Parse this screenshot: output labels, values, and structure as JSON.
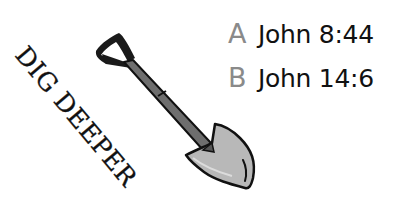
{
  "title": "DIG DEEPER",
  "illustration": {
    "icon": "shovel-icon",
    "colors": {
      "outline": "#111111",
      "handle": "#555555",
      "blade": "#b8b8b8"
    }
  },
  "references": [
    {
      "letter": "A",
      "text": "John 8:44"
    },
    {
      "letter": "B",
      "text": "John 14:6"
    }
  ],
  "colors": {
    "letter": "#8a8a8a",
    "text": "#111111",
    "background": "#ffffff"
  }
}
